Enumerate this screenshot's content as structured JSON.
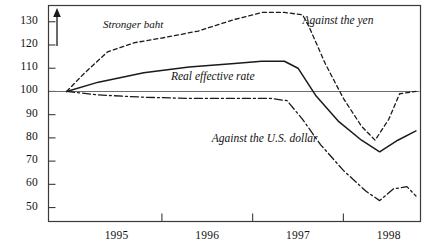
{
  "chart_data": {
    "type": "line",
    "title": "",
    "subtitle": "",
    "xlabel": "",
    "ylabel": "",
    "xlim": [
      1994.75,
      1998.85
    ],
    "ylim": [
      44,
      137
    ],
    "grid": false,
    "legend_position": "inline-annotations",
    "baseline": 100,
    "x_tick_labels": [
      "1995",
      "1996",
      "1997",
      "1998"
    ],
    "x_tick_values": [
      1995.5,
      1996.5,
      1997.5,
      1998.5
    ],
    "y_tick_labels": [
      "130",
      "120",
      "110",
      "100",
      "90",
      "80",
      "70",
      "60",
      "50"
    ],
    "y_tick_values": [
      130,
      120,
      110,
      100,
      90,
      80,
      70,
      60,
      50
    ],
    "annotations": [
      {
        "name": "stronger-baht",
        "text": "Stronger baht",
        "x": 1995.35,
        "y": 128
      },
      {
        "name": "up-arrow",
        "text": "↑",
        "x": 1995.1,
        "y": 124
      }
    ],
    "series": [
      {
        "name": "Against the yen",
        "label": "Against the yen",
        "style": "dotted",
        "label_x": 1997.55,
        "label_y": 130,
        "x": [
          1994.95,
          1995.15,
          1995.4,
          1995.7,
          1996.0,
          1996.4,
          1996.8,
          1997.1,
          1997.35,
          1997.55,
          1997.62,
          1997.8,
          1998.0,
          1998.2,
          1998.35,
          1998.5,
          1998.62,
          1998.8
        ],
        "y": [
          100,
          108,
          117,
          121,
          123,
          126,
          131,
          134,
          134,
          133,
          128,
          112,
          97,
          85,
          79,
          88,
          99,
          100
        ]
      },
      {
        "name": "Real effective rate",
        "label": "Real effective rate",
        "style": "solid",
        "label_x": 1996.1,
        "label_y": 106,
        "x": [
          1994.95,
          1995.3,
          1995.8,
          1996.3,
          1996.8,
          1997.1,
          1997.35,
          1997.5,
          1997.7,
          1997.95,
          1998.2,
          1998.4,
          1998.6,
          1998.8
        ],
        "y": [
          100,
          104,
          108,
          110.5,
          112,
          113,
          113,
          110,
          98,
          87,
          79,
          74,
          79,
          83
        ]
      },
      {
        "name": "Against the U.S. dollar",
        "label": "Against the U.S. dollar",
        "style": "dash-dot",
        "label_x": 1996.55,
        "label_y": 79,
        "x": [
          1994.95,
          1995.3,
          1995.8,
          1996.3,
          1996.8,
          1997.2,
          1997.38,
          1997.55,
          1997.75,
          1998.0,
          1998.25,
          1998.4,
          1998.55,
          1998.7,
          1998.8
        ],
        "y": [
          100,
          98.5,
          97.5,
          97,
          97,
          97,
          96,
          88,
          77,
          66,
          57,
          53,
          58,
          59,
          55
        ]
      }
    ]
  },
  "colors": {
    "axis": "#3a3a3a",
    "baseline": "#6b6b6b",
    "line": "#1a1a1a",
    "background": "#ffffff"
  }
}
